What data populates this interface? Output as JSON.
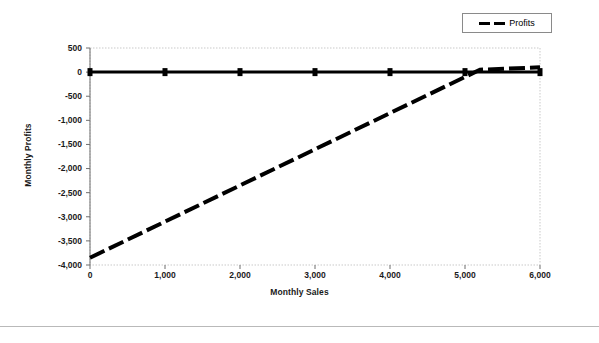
{
  "legend": {
    "entries": [
      {
        "label": "Profits",
        "style": "dashed",
        "color": "#000000"
      }
    ]
  },
  "axes": {
    "x_title": "Monthly Sales",
    "y_title": "Monthly Profits",
    "x_ticks": [
      "0",
      "1,000",
      "2,000",
      "3,000",
      "4,000",
      "5,000",
      "6,000"
    ],
    "y_ticks": [
      "500",
      "0",
      "-500",
      "-1,000",
      "-1,500",
      "-2,000",
      "-2,500",
      "-3,000",
      "-3,500",
      "-4,000"
    ]
  },
  "chart_data": {
    "type": "line",
    "title": "",
    "xlabel": "Monthly Sales",
    "ylabel": "Monthly Profits",
    "xlim": [
      0,
      6000
    ],
    "ylim": [
      -4000,
      500
    ],
    "grid": false,
    "legend_position": "top-right",
    "x_ticks": [
      0,
      1000,
      2000,
      3000,
      4000,
      5000,
      6000
    ],
    "y_ticks": [
      500,
      0,
      -500,
      -1000,
      -1500,
      -2000,
      -2500,
      -3000,
      -3500,
      -4000
    ],
    "series": [
      {
        "name": "Zero line",
        "style": "solid",
        "marker": "square",
        "color": "#000000",
        "x": [
          0,
          1000,
          2000,
          3000,
          4000,
          5000,
          6000
        ],
        "values": [
          0,
          0,
          0,
          0,
          0,
          0,
          0
        ]
      },
      {
        "name": "Profits",
        "style": "dashed",
        "marker": "none",
        "color": "#000000",
        "x": [
          0,
          1000,
          2000,
          3000,
          4000,
          5000,
          5200,
          6000
        ],
        "values": [
          -3850,
          -3100,
          -2350,
          -1600,
          -850,
          -100,
          50,
          100
        ]
      }
    ]
  }
}
